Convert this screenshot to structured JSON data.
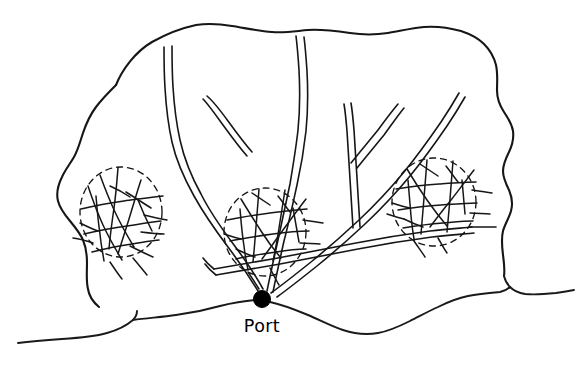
{
  "figure": {
    "type": "hand-drawn-schematic-map",
    "title": "",
    "background_color": "#ffffff",
    "ink_color": "#161616",
    "width": 582,
    "height": 368
  },
  "labels": {
    "port": "Port"
  },
  "markers": {
    "port_node": {
      "name": "port",
      "x": 262,
      "y": 299,
      "radius": 8.5,
      "fill": "#000000"
    }
  },
  "regions": [
    {
      "name": "left-city",
      "center_x": 121,
      "center_y": 212,
      "radius_x": 41,
      "radius_y": 45,
      "style": "dashed-circle"
    },
    {
      "name": "center-city",
      "center_x": 265,
      "center_y": 232,
      "radius_x": 41,
      "radius_y": 44,
      "style": "dashed-circle"
    },
    {
      "name": "right-city",
      "center_x": 434,
      "center_y": 202,
      "radius_x": 42,
      "radius_y": 44,
      "style": "dashed-circle"
    }
  ],
  "geography": {
    "landmass_name": "hinterland-outline",
    "coastline_name": "coastline"
  },
  "roads": {
    "count": 5,
    "description": "double-line trunk roads radiating from the port",
    "style": "double-line"
  }
}
